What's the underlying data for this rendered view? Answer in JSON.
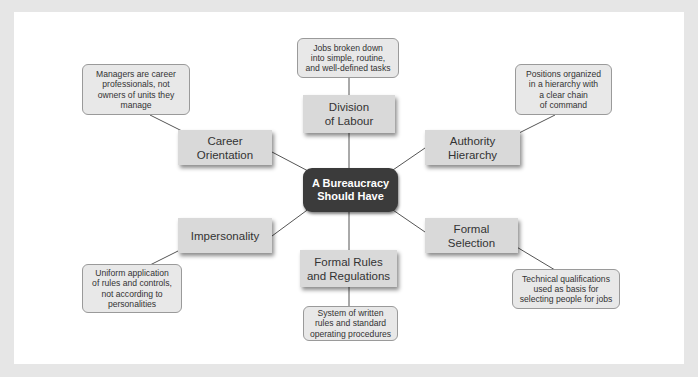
{
  "diagram": {
    "center": {
      "label": "A Bureaucracy\nShould Have"
    },
    "branches": [
      {
        "id": "division",
        "label": "Division\nof Labour",
        "callout": "Jobs broken down\ninto simple, routine,\nand well-defined tasks"
      },
      {
        "id": "career",
        "label": "Career\nOrientation",
        "callout": "Managers are career\nprofessionals, not\nowners of units they\nmanage"
      },
      {
        "id": "authority",
        "label": "Authority\nHierarchy",
        "callout": "Positions organized\nin a hierarchy with\na clear chain\nof command"
      },
      {
        "id": "impersonality",
        "label": "Impersonality",
        "callout": "Uniform application\nof rules and controls,\nnot according to\npersonalities"
      },
      {
        "id": "selection",
        "label": "Formal\nSelection",
        "callout": "Technical qualifications\nused as basis for\nselecting people for jobs"
      },
      {
        "id": "rules",
        "label": "Formal Rules\nand Regulations",
        "callout": "System of written\nrules and standard\noperating procedures"
      }
    ]
  },
  "colors": {
    "center_fill": "#3b3b3b",
    "node_fill": "#d9d9d9",
    "callout_fill": "#e8e8e8",
    "frame": "#e6e6e6"
  }
}
